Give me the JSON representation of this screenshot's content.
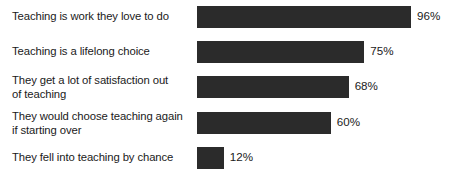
{
  "chart_data": {
    "type": "bar",
    "orientation": "horizontal",
    "title": "",
    "subtitle": "",
    "xlabel": "",
    "ylabel": "",
    "xlim": [
      0,
      100
    ],
    "grid": false,
    "legend": false,
    "value_suffix": "%",
    "bar_color": "#2b2b2b",
    "text_color": "#1a1a1a",
    "background_color": "#ffffff",
    "categories": [
      "Teaching is work they love to do",
      "Teaching is a lifelong choice",
      "They get a lot of satisfaction out of teaching",
      "They would choose teaching again if starting over",
      "They fell into teaching by chance"
    ],
    "values": [
      96,
      75,
      68,
      60,
      12
    ],
    "value_labels": [
      "96%",
      "75%",
      "68%",
      "60%",
      "12%"
    ],
    "bars": [
      {
        "label": "Teaching is work they love to do",
        "label_lines": "Teaching is work they love to do",
        "value": 96,
        "value_label": "96%"
      },
      {
        "label": "Teaching is a lifelong choice",
        "label_lines": "Teaching is a lifelong choice",
        "value": 75,
        "value_label": "75%"
      },
      {
        "label": "They get a lot of satisfaction out of teaching",
        "label_lines": "They get a lot of satisfaction out\nof teaching",
        "value": 68,
        "value_label": "68%"
      },
      {
        "label": "They would choose teaching again if starting over",
        "label_lines": "They would choose teaching again\nif starting over",
        "value": 60,
        "value_label": "60%"
      },
      {
        "label": "They fell into teaching by chance",
        "label_lines": "They fell into teaching by chance",
        "value": 12,
        "value_label": "12%"
      }
    ]
  }
}
